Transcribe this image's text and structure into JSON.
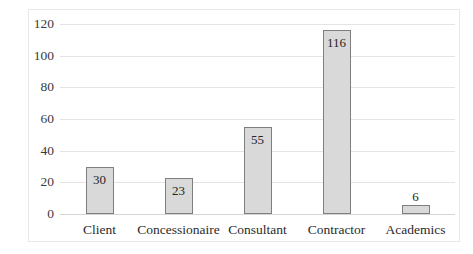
{
  "chart_data": {
    "type": "bar",
    "title": "",
    "subtitle": "",
    "xlabel": "",
    "ylabel": "",
    "categories": [
      "Client",
      "Concessionaire",
      "Consultant",
      "Contractor",
      "Academics"
    ],
    "values": [
      30,
      23,
      55,
      116,
      6
    ],
    "data_labels": [
      "30",
      "23",
      "55",
      "116",
      "6"
    ],
    "label_placement": [
      "inside",
      "inside",
      "inside",
      "inside",
      "outside"
    ],
    "ylim": [
      0,
      120
    ],
    "yticks": [
      0,
      20,
      40,
      60,
      80,
      100,
      120
    ],
    "ytick_labels": [
      "0",
      "20",
      "40",
      "60",
      "80",
      "100",
      "120"
    ],
    "grid": {
      "horizontal": true,
      "vertical": false
    },
    "legend": {
      "visible": false,
      "position": "none"
    },
    "colors": {
      "bar_fill": "#d9d9d9",
      "bar_border": "#7f7f7f",
      "gridline": "#e4e4e4",
      "baseline": "#d5d5d5",
      "plot_background": "#ffffff",
      "frame_border": "#e8e8e8",
      "tick_text": "#3a3a3a",
      "category_text": "#2b2b2b",
      "data_label_text": "#252525"
    }
  }
}
